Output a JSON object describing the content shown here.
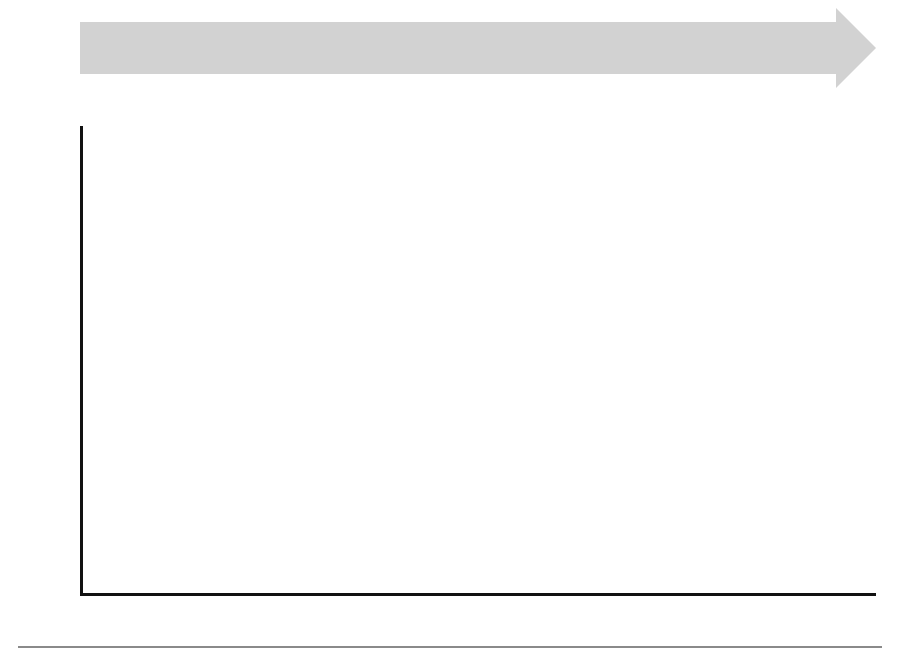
{
  "axes": {
    "ylabel": "Number of LNG Ships Delivered",
    "yticks": [
      0,
      5,
      10,
      15,
      20,
      25,
      30,
      35,
      40,
      45,
      50
    ],
    "ylim": [
      0,
      50
    ],
    "xticks": [
      "1969",
      "1971",
      "1973",
      "1975",
      "1977",
      "1979",
      "1981",
      "1983",
      "1985",
      "1987",
      "1989",
      "1991",
      "1993",
      "1995",
      "1997",
      "1999",
      "2001",
      "2003",
      "2005",
      "2007",
      "2009",
      "2011",
      "2013"
    ]
  },
  "legend": {
    "items": [
      {
        "label": "South Korea",
        "color": "#000000"
      },
      {
        "label": "Japan",
        "color": "#595959"
      },
      {
        "label": "China",
        "color": "#b5b5b5"
      },
      {
        "label": "Europe",
        "color": "#333333"
      },
      {
        "label": "USA",
        "color": "#dcdcdc"
      }
    ]
  },
  "timeline": {
    "band_color": "#d2d2d2",
    "events": [
      {
        "year": "1969",
        "desc": "SWEDEN & ITALY (GT–Prism)"
      },
      {
        "year": "1970",
        "desc": "SPAIN (Prism–GT)"
      },
      {
        "year": "1973",
        "desc": "FRANCE (GT–TGZ–CS1)"
      },
      {
        "year": "1973",
        "desc": "NORWAY (Moss)"
      },
      {
        "year": "1977",
        "desc": "GERMANY & USA (Moss–TGZ)"
      },
      {
        "year": "1981",
        "desc": "JAPAN (Moss–TGZ–GT)"
      },
      {
        "year": "1994",
        "desc": "SOUTH KOREA (Moss–TGZ–GT)"
      },
      {
        "year": "1996",
        "desc": "FINLAND (Moss)"
      },
      {
        "year": "2003",
        "desc": "SPAIN'S RE-ENTRY (GT)"
      },
      {
        "year": "2007",
        "desc": "KOREAN Q-SIZED SHIPS (GT–TGZ)"
      },
      {
        "year": "2008",
        "desc": "CHINA (GT)"
      }
    ]
  },
  "chart_data": {
    "type": "bar",
    "stacked": true,
    "title": "",
    "xlabel": "",
    "ylabel": "Number of LNG Ships Delivered",
    "ylim": [
      0,
      50
    ],
    "grid": true,
    "legend_position": "center",
    "categories": [
      "1969",
      "1970",
      "1971",
      "1972",
      "1973",
      "1974",
      "1975",
      "1976",
      "1977",
      "1978",
      "1979",
      "1980",
      "1981",
      "1982",
      "1983",
      "1984",
      "1985",
      "1986",
      "1987",
      "1988",
      "1989",
      "1990",
      "1991",
      "1992",
      "1993",
      "1994",
      "1995",
      "1996",
      "1997",
      "1998",
      "1999",
      "2000",
      "2001",
      "2002",
      "2003",
      "2004",
      "2005",
      "2006",
      "2007",
      "2008",
      "2009",
      "2010",
      "2011",
      "2012",
      "2013"
    ],
    "series": [
      {
        "name": "South Korea",
        "color": "#000000",
        "values": [
          0,
          0,
          0,
          0,
          0,
          0,
          0,
          0,
          0,
          0,
          0,
          0,
          0,
          0,
          0,
          0,
          0,
          0,
          0,
          0,
          0,
          0,
          0,
          0,
          0,
          1.5,
          0.7,
          1.2,
          1.7,
          0,
          0,
          8.2,
          0,
          4.5,
          8.4,
          10.5,
          14.5,
          16.5,
          24.2,
          37.2,
          29.3,
          0,
          9.5,
          0.8,
          17.2
        ]
      },
      {
        "name": "Japan",
        "color": "#595959",
        "values": [
          0,
          0,
          0,
          0,
          0,
          0,
          0,
          0,
          0,
          0,
          0,
          0,
          0,
          3.9,
          2.5,
          0.8,
          0,
          0,
          0,
          2.7,
          1.7,
          0.8,
          0.8,
          3.2,
          6.0,
          2.8,
          4.3,
          3.8,
          3.5,
          4.3,
          4.3,
          0,
          0,
          3.8,
          2.4,
          4.3,
          1.7,
          7.4,
          7.2,
          8.8,
          8.2,
          0,
          0.5,
          0.6,
          0.9
        ]
      },
      {
        "name": "China",
        "color": "#b5b5b5",
        "values": [
          0,
          0,
          0,
          0,
          0,
          0,
          0,
          0,
          0,
          0,
          0,
          0,
          0,
          0,
          0,
          0,
          0,
          0,
          0,
          0,
          0,
          0,
          0,
          0,
          0,
          0,
          0,
          0,
          0,
          0,
          0,
          0,
          0,
          0,
          0,
          0,
          0,
          0,
          0,
          2.2,
          3.6,
          0,
          0,
          0.5,
          0
        ]
      },
      {
        "name": "Europe",
        "color": "#333333",
        "values": [
          2.0,
          0,
          0.9,
          0,
          0,
          0,
          2.9,
          2.9,
          6.0,
          1.0,
          1.0,
          1.9,
          6.9,
          0,
          0,
          0,
          0.8,
          0,
          0,
          0,
          0,
          0,
          0,
          0,
          0,
          1.0,
          0,
          1.4,
          1.3,
          0,
          1.2,
          4.3,
          0.5,
          1.2,
          2.7,
          4.7,
          1.1,
          2.3,
          0.8,
          0,
          0,
          0,
          0,
          0.3,
          0
        ]
      },
      {
        "name": "USA",
        "color": "#dcdcdc",
        "values": [
          0,
          0,
          0,
          0,
          0,
          0,
          0,
          0,
          2.0,
          3.0,
          3.0,
          2.0,
          0,
          0,
          0,
          0,
          0,
          0,
          0,
          0,
          0,
          0,
          0,
          0,
          0,
          0,
          0,
          0,
          0,
          0,
          0,
          0,
          0,
          0,
          0,
          0,
          0,
          0,
          0,
          0,
          0,
          0,
          0,
          0,
          0
        ]
      }
    ]
  }
}
